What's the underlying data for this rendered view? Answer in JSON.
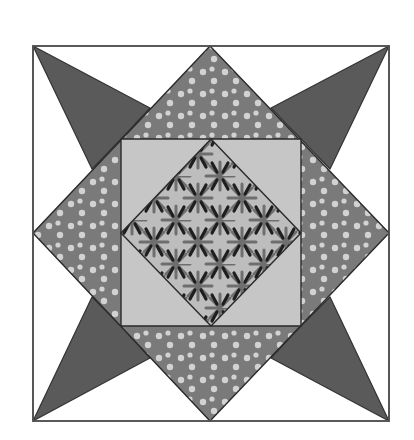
{
  "block": {
    "name": "quilt-star-block",
    "bounds": {
      "x1": 33,
      "y1": 46,
      "x2": 389,
      "y2": 421
    },
    "colors": {
      "background": "#ffffff",
      "outline": "#333333",
      "star_points": "#5a5a5a",
      "dotted_fabric": "#7a7a7a",
      "dot": "#d2d2d2",
      "inner_square": "#c6c6c6",
      "center_base": "#bdbdbd",
      "center_motif_dark": "#1e1e1e",
      "center_motif_mid": "#6e6e6e"
    },
    "pieces": {
      "outer_square": "33,46 389,46 389,421 33,421",
      "dotted_diamond": "210,46 389,233 210,421 33,233",
      "inner_square": "121,139 301,139 301,326 121,326",
      "center_diamond": "211,139 301,233 211,326 121,233",
      "star_points": [
        {
          "name": "star-point-top-left",
          "points": "33,46 150,108 121,139 92,169"
        },
        {
          "name": "star-point-top-right",
          "points": "389,46 330,169 301,139 271,108"
        },
        {
          "name": "star-point-bottom-right",
          "points": "389,421 271,358 301,326 330,297"
        },
        {
          "name": "star-point-bottom-left",
          "points": "33,421 92,297 121,326 150,358"
        }
      ]
    }
  }
}
